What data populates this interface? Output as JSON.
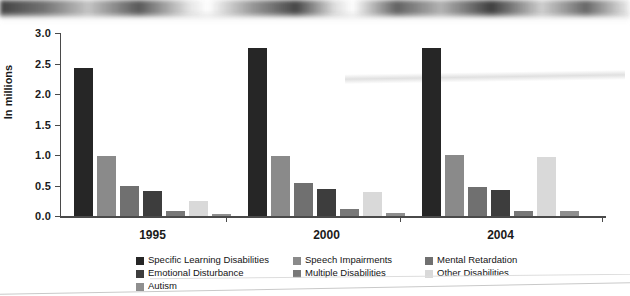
{
  "chart_data": {
    "type": "bar",
    "title": "",
    "subtitle": "",
    "xlabel": "",
    "ylabel": "In millions",
    "categories": [
      "1995",
      "2000",
      "2004"
    ],
    "ylim": [
      0.0,
      3.0
    ],
    "ytick_labels": [
      "0.0",
      "0.5",
      "1.0",
      "1.5",
      "2.0",
      "2.5",
      "3.0"
    ],
    "ytick_values": [
      0.0,
      0.5,
      1.0,
      1.5,
      2.0,
      2.5,
      3.0
    ],
    "grid": false,
    "legend_position": "bottom",
    "series": [
      {
        "name": "Specific Learning Disabilities",
        "color": "#262626",
        "values": [
          2.43,
          2.76,
          2.76
        ]
      },
      {
        "name": "Speech Impairments",
        "color": "#8a8a8a",
        "values": [
          0.98,
          0.99,
          1.0
        ]
      },
      {
        "name": "Mental Retardation",
        "color": "#707070",
        "values": [
          0.49,
          0.54,
          0.47
        ]
      },
      {
        "name": "Emotional Disturbance",
        "color": "#3d3d3d",
        "values": [
          0.41,
          0.44,
          0.43
        ]
      },
      {
        "name": "Multiple Disabilities",
        "color": "#787878",
        "values": [
          0.09,
          0.11,
          0.08
        ]
      },
      {
        "name": "Other Disabilities",
        "color": "#d9d9d9",
        "values": [
          0.24,
          0.39,
          0.97
        ]
      },
      {
        "name": "Autism",
        "color": "#8f8f8f",
        "values": [
          0.03,
          0.05,
          0.08
        ]
      }
    ]
  },
  "legend": {
    "entries": [
      {
        "label": "Specific Learning Disabilities",
        "color": "#262626"
      },
      {
        "label": "Speech Impairments",
        "color": "#8a8a8a"
      },
      {
        "label": "Mental Retardation",
        "color": "#707070"
      },
      {
        "label": "Emotional Disturbance",
        "color": "#3d3d3d"
      },
      {
        "label": "Multiple Disabilities",
        "color": "#787878"
      },
      {
        "label": "Other Disabilities",
        "color": "#d9d9d9"
      },
      {
        "label": "Autism",
        "color": "#8f8f8f"
      }
    ]
  }
}
